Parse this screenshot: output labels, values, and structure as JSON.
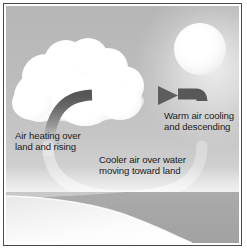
{
  "figure": {
    "border_color": "#4a4a4a"
  },
  "sky": {
    "gradient_top": "#b6b6b6",
    "gradient_bottom": "#e2e2e2"
  },
  "elements": {
    "sun": {
      "name": "sun",
      "color": "#ffffff"
    },
    "cloud": {
      "name": "cloud",
      "color": "#ffffff"
    },
    "land": {
      "name": "land",
      "color": "#f4f4f4"
    },
    "water": {
      "name": "water",
      "color": "#a7a7a7"
    },
    "arrow": {
      "name": "circulation-arrow",
      "color": "#5b5b5b"
    }
  },
  "labels": {
    "left": {
      "line1": "Air heating over",
      "line2": "land and rising"
    },
    "right": {
      "line1": "Warm air cooling",
      "line2": "and descending"
    },
    "bottom": {
      "line1": "Cooler air over water",
      "line2": "moving toward land"
    }
  }
}
